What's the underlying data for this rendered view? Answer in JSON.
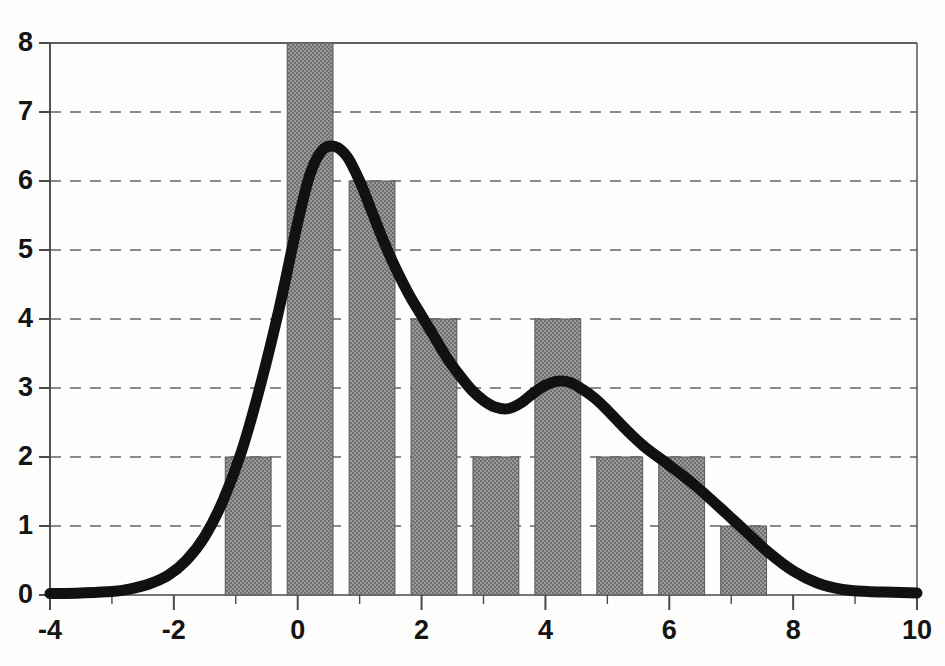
{
  "chart_data": {
    "type": "bar",
    "title": "",
    "subtitle": "",
    "xlabel": "",
    "ylabel": "",
    "xlim": [
      -4,
      10
    ],
    "ylim": [
      0,
      8
    ],
    "grid": true,
    "grid_axis": "y",
    "legend": false,
    "legend_position": "none",
    "xticks": [
      -4,
      -2,
      0,
      2,
      4,
      6,
      8,
      10
    ],
    "xtick_labels": [
      "-4",
      "-2",
      "0",
      "2",
      "4",
      "6",
      "8",
      "10"
    ],
    "xminor_ticks": [
      -4,
      -3,
      -2,
      -1,
      0,
      1,
      2,
      3,
      4,
      5,
      6,
      7,
      8,
      9,
      10
    ],
    "yticks": [
      0,
      1,
      2,
      3,
      4,
      5,
      6,
      7,
      8
    ],
    "ytick_labels": [
      "0",
      "1",
      "2",
      "3",
      "4",
      "5",
      "6",
      "7",
      "8"
    ],
    "bin_width": 1,
    "bar_gap_fraction": 0.26,
    "bin_edges": [
      -1.3,
      -0.3,
      0.7,
      1.7,
      2.7,
      3.7,
      4.7,
      5.7,
      6.7,
      7.7
    ],
    "bin_centers": [
      -0.8,
      0.2,
      1.2,
      2.2,
      3.2,
      4.2,
      5.2,
      6.2,
      7.2
    ],
    "categories": [
      "-1.3 to -0.3",
      "-0.3 to 0.7",
      "0.7 to 1.7",
      "1.7 to 2.7",
      "2.7 to 3.7",
      "3.7 to 4.7",
      "4.7 to 5.7",
      "5.7 to 6.7",
      "6.7 to 7.7"
    ],
    "values": [
      2,
      8,
      6,
      4,
      2,
      4,
      2,
      2,
      1
    ],
    "series": [
      {
        "name": "histogram",
        "kind": "bar",
        "values": [
          2,
          8,
          6,
          4,
          2,
          4,
          2,
          2,
          1
        ],
        "fill": "#808080",
        "pattern": "checkerboard-dither",
        "edge_color": "#555555"
      },
      {
        "name": "density-curve",
        "kind": "line",
        "color": "#111111",
        "line_width": 11,
        "x": [
          -4.0,
          -3.5,
          -3.0,
          -2.7,
          -2.4,
          -2.1,
          -1.8,
          -1.5,
          -1.2,
          -0.9,
          -0.6,
          -0.3,
          0.0,
          0.2,
          0.4,
          0.6,
          0.8,
          1.0,
          1.2,
          1.4,
          1.6,
          1.8,
          2.0,
          2.2,
          2.4,
          2.6,
          2.8,
          3.0,
          3.2,
          3.4,
          3.6,
          3.8,
          4.0,
          4.2,
          4.4,
          4.6,
          4.8,
          5.0,
          5.3,
          5.6,
          6.0,
          6.4,
          6.8,
          7.2,
          7.6,
          8.0,
          8.4,
          8.8,
          9.2,
          9.6,
          10.0
        ],
        "y": [
          0.02,
          0.03,
          0.05,
          0.09,
          0.16,
          0.28,
          0.5,
          0.85,
          1.38,
          2.1,
          3.05,
          4.15,
          5.4,
          6.1,
          6.45,
          6.5,
          6.35,
          6.0,
          5.55,
          5.1,
          4.7,
          4.35,
          4.05,
          3.75,
          3.45,
          3.2,
          2.98,
          2.82,
          2.72,
          2.7,
          2.78,
          2.92,
          3.04,
          3.1,
          3.08,
          2.98,
          2.85,
          2.68,
          2.4,
          2.15,
          1.88,
          1.6,
          1.28,
          0.95,
          0.62,
          0.35,
          0.17,
          0.08,
          0.05,
          0.04,
          0.03
        ]
      }
    ],
    "annotations": []
  },
  "axes": {
    "y_ticks": [
      {
        "label": "8",
        "value": 8
      },
      {
        "label": "7",
        "value": 7
      },
      {
        "label": "6",
        "value": 6
      },
      {
        "label": "5",
        "value": 5
      },
      {
        "label": "4",
        "value": 4
      },
      {
        "label": "3",
        "value": 3
      },
      {
        "label": "2",
        "value": 2
      },
      {
        "label": "1",
        "value": 1
      },
      {
        "label": "0",
        "value": 0
      }
    ],
    "x_ticks": [
      {
        "label": "-4",
        "value": -4
      },
      {
        "label": "-2",
        "value": -2
      },
      {
        "label": "0",
        "value": 0
      },
      {
        "label": "2",
        "value": 2
      },
      {
        "label": "4",
        "value": 4
      },
      {
        "label": "6",
        "value": 6
      },
      {
        "label": "8",
        "value": 8
      },
      {
        "label": "10",
        "value": 10
      }
    ]
  },
  "colors": {
    "bar_fill": "#808080",
    "bar_edge": "#595959",
    "curve": "#111111",
    "grid": "#8a8a8a",
    "axis": "#4a4a4a",
    "text": "#141414",
    "background": "#fdfdfc"
  }
}
